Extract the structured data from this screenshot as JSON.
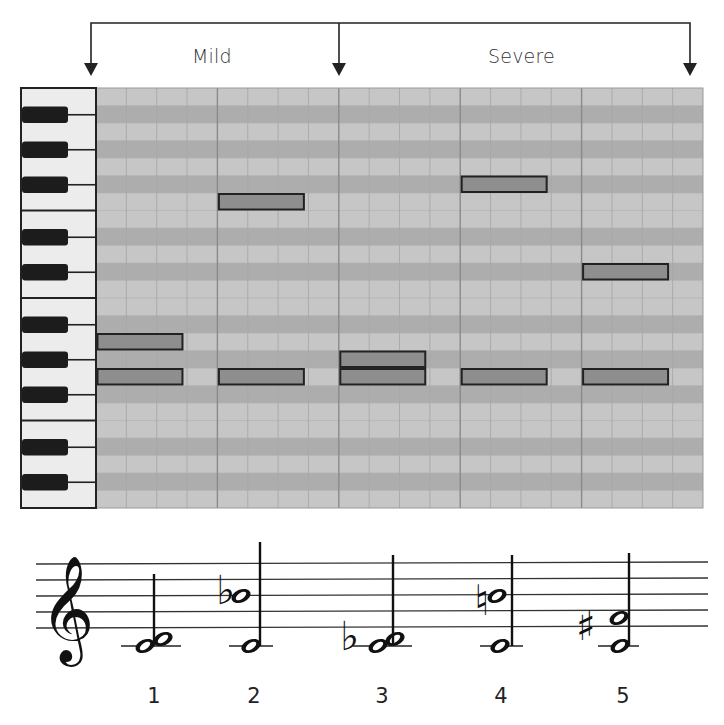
{
  "header": {
    "ranges": [
      {
        "label": "Mild",
        "from_bar": 0,
        "to_bar": 2
      },
      {
        "label": "Severe",
        "from_bar": 2,
        "to_bar": 5
      }
    ]
  },
  "piano_roll": {
    "rows": 24,
    "bars": 5,
    "subdivisions_per_bar": 4,
    "note_fill": "#8e8e8e",
    "note_border": "#222222",
    "light_row": "#c6c6c6",
    "dark_row": "#adadad",
    "notes": [
      {
        "group": 1,
        "bar": 0,
        "row": 14
      },
      {
        "group": 1,
        "bar": 0,
        "row": 16
      },
      {
        "group": 2,
        "bar": 1,
        "row": 6
      },
      {
        "group": 2,
        "bar": 1,
        "row": 16
      },
      {
        "group": 3,
        "bar": 2,
        "row": 15
      },
      {
        "group": 3,
        "bar": 2,
        "row": 16
      },
      {
        "group": 4,
        "bar": 3,
        "row": 5
      },
      {
        "group": 4,
        "bar": 3,
        "row": 16
      },
      {
        "group": 5,
        "bar": 4,
        "row": 10
      },
      {
        "group": 5,
        "bar": 4,
        "row": 16
      }
    ]
  },
  "staff": {
    "clef": "treble-clef",
    "chords": [
      {
        "number": "1",
        "accidental": "",
        "description": "C4 + D4 (second)"
      },
      {
        "number": "2",
        "accidental": "flat",
        "description": "C4 + Bb4"
      },
      {
        "number": "3",
        "accidental": "flat",
        "description": "C4 + Db4 (minor second)"
      },
      {
        "number": "4",
        "accidental": "natural",
        "description": "C4 + B4"
      },
      {
        "number": "5",
        "accidental": "sharp",
        "description": "C4 + F#4 (tritone)"
      }
    ]
  }
}
